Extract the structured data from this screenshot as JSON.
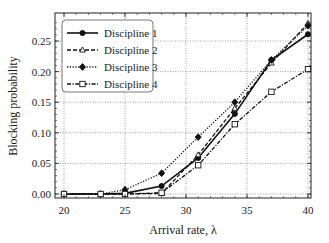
{
  "chart_data": {
    "type": "line",
    "title": "",
    "xlabel": "Arrival rate, λ",
    "ylabel": "Blocking probability",
    "xlim": [
      19.5,
      40.2
    ],
    "ylim": [
      -0.003,
      0.29
    ],
    "xticks": [
      20,
      25,
      30,
      35,
      40
    ],
    "xtick_labels": [
      "20",
      "25",
      "30",
      "35",
      "40"
    ],
    "yticks": [
      0.0,
      0.05,
      0.1,
      0.15,
      0.2,
      0.25
    ],
    "ytick_labels": [
      "0.00",
      "0.05",
      "0.10",
      "0.15",
      "0.20",
      "0.25"
    ],
    "grid": true,
    "legend_position": "upper left",
    "x": [
      20,
      23,
      25,
      28,
      31,
      34,
      37,
      40
    ],
    "series": [
      {
        "name": "Discipline 1",
        "line": "solid",
        "marker": "circle-filled",
        "values": [
          0.0,
          0.0,
          0.001,
          0.013,
          0.059,
          0.131,
          0.219,
          0.261
        ]
      },
      {
        "name": "Discipline 2",
        "line": "dashed",
        "marker": "triangle-open",
        "values": [
          0.0,
          0.0,
          0.0,
          0.001,
          0.064,
          0.14,
          0.214,
          0.279
        ]
      },
      {
        "name": "Discipline 3",
        "line": "dotted",
        "marker": "diamond-filled",
        "values": [
          0.0,
          0.0,
          0.007,
          0.034,
          0.093,
          0.15,
          0.219,
          0.275
        ]
      },
      {
        "name": "Discipline 4",
        "line": "dashdot",
        "marker": "square-open",
        "values": [
          0.0,
          0.0,
          0.0,
          0.002,
          0.047,
          0.114,
          0.167,
          0.204
        ]
      }
    ]
  }
}
